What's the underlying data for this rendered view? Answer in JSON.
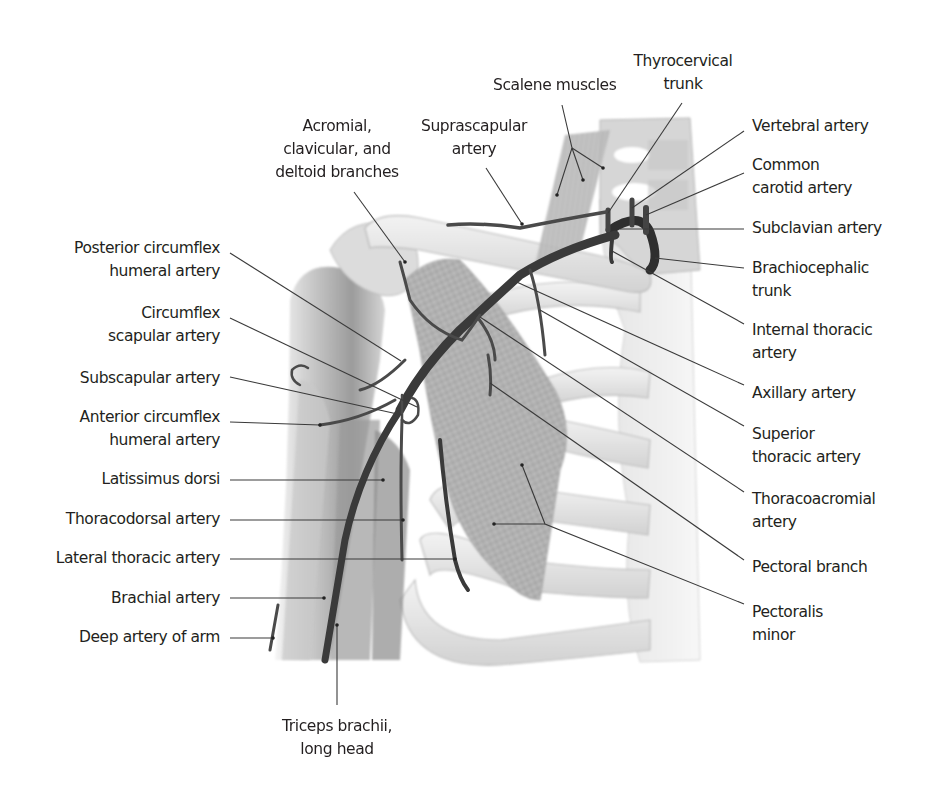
{
  "figure": {
    "colors": {
      "background": "#ffffff",
      "text": "#231f20",
      "leader_line": "#3a3a3a",
      "artery": "#4a4a4a",
      "artery_dark": "#2e2e2e",
      "bone": "#ececec",
      "bone_shade": "#c9c9c9",
      "muscle": "#b4b4b4",
      "muscle_dark": "#8c8c8c"
    }
  },
  "labels": {
    "top": {
      "thyrocervical_trunk": [
        "Thyrocervical",
        "trunk"
      ],
      "scalene_muscles": [
        "Scalene muscles"
      ],
      "acromial_branches": [
        "Acromial,",
        "clavicular, and",
        "deltoid branches"
      ],
      "suprascapular_artery": [
        "Suprascapular",
        "artery"
      ]
    },
    "right": {
      "vertebral_artery": [
        "Vertebral artery"
      ],
      "common_carotid_artery": [
        "Common",
        "carotid artery"
      ],
      "subclavian_artery": [
        "Subclavian artery"
      ],
      "brachiocephalic_trunk": [
        "Brachiocephalic",
        "trunk"
      ],
      "internal_thoracic_artery": [
        "Internal thoracic",
        "artery"
      ],
      "axillary_artery": [
        "Axillary artery"
      ],
      "superior_thoracic_artery": [
        "Superior",
        "thoracic artery"
      ],
      "thoracoacromial_artery": [
        "Thoracoacromial",
        "artery"
      ],
      "pectoral_branch": [
        "Pectoral branch"
      ],
      "pectoralis_minor": [
        "Pectoralis",
        "minor"
      ]
    },
    "left": {
      "posterior_circumflex_humeral_artery": [
        "Posterior circumflex",
        "humeral artery"
      ],
      "circumflex_scapular_artery": [
        "Circumflex",
        "scapular artery"
      ],
      "subscapular_artery": [
        "Subscapular artery"
      ],
      "anterior_circumflex_humeral_artery": [
        "Anterior circumflex",
        "humeral artery"
      ],
      "latissimus_dorsi": [
        "Latissimus dorsi"
      ],
      "thoracodorsal_artery": [
        "Thoracodorsal artery"
      ],
      "lateral_thoracic_artery": [
        "Lateral thoracic artery"
      ],
      "brachial_artery": [
        "Brachial artery"
      ],
      "deep_artery_of_arm": [
        "Deep artery of arm"
      ]
    },
    "bottom": {
      "triceps_brachii_long_head": [
        "Triceps brachii,",
        "long head"
      ]
    }
  }
}
